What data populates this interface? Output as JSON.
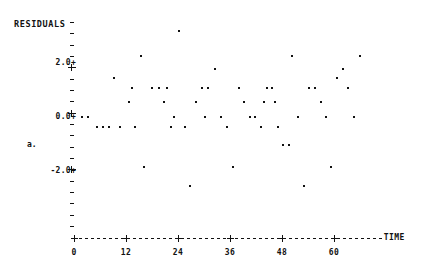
{
  "chart_data": {
    "type": "scatter",
    "title": "",
    "ylabel": "RESIDUALS",
    "xlabel": "TIME",
    "stray_label": "a.",
    "xlim": [
      0,
      70
    ],
    "ylim": [
      -3.0,
      3.0
    ],
    "grid": false,
    "legend": null,
    "x_ticks": [
      0,
      12,
      24,
      36,
      48,
      60
    ],
    "x_tick_labels": [
      "0",
      "12",
      "24",
      "36",
      "48",
      "60"
    ],
    "y_ticks": [
      2.0,
      0.0,
      -2.0
    ],
    "y_tick_labels": [
      "2.0+",
      "0.0+",
      "-2.0+"
    ],
    "y_minor_count": 19,
    "point_marker": "*",
    "points": [
      {
        "x": 1.8,
        "y": 0.0
      },
      {
        "x": 3.2,
        "y": 0.0
      },
      {
        "x": 5.3,
        "y": -0.38
      },
      {
        "x": 6.7,
        "y": -0.38
      },
      {
        "x": 8.1,
        "y": -0.38
      },
      {
        "x": 10.6,
        "y": -0.38
      },
      {
        "x": 9.2,
        "y": 1.43
      },
      {
        "x": 12.6,
        "y": 0.55
      },
      {
        "x": 14.0,
        "y": -0.38
      },
      {
        "x": 15.5,
        "y": 2.26
      },
      {
        "x": 16.2,
        "y": -1.85
      },
      {
        "x": 18.0,
        "y": 1.09
      },
      {
        "x": 19.5,
        "y": 1.09
      },
      {
        "x": 20.8,
        "y": 0.55
      },
      {
        "x": 22.4,
        "y": -0.38
      },
      {
        "x": 24.3,
        "y": 3.2
      },
      {
        "x": 25.6,
        "y": -0.38
      },
      {
        "x": 26.8,
        "y": -2.55
      },
      {
        "x": 28.2,
        "y": 0.55
      },
      {
        "x": 29.6,
        "y": 1.09
      },
      {
        "x": 31.0,
        "y": 1.09
      },
      {
        "x": 32.5,
        "y": 1.76
      },
      {
        "x": 34.0,
        "y": 0.0
      },
      {
        "x": 35.4,
        "y": -0.38
      },
      {
        "x": 36.6,
        "y": -1.85
      },
      {
        "x": 38.0,
        "y": 1.09
      },
      {
        "x": 39.3,
        "y": 0.55
      },
      {
        "x": 40.6,
        "y": 0.0
      },
      {
        "x": 41.8,
        "y": 0.0
      },
      {
        "x": 43.1,
        "y": -0.38
      },
      {
        "x": 44.5,
        "y": 1.09
      },
      {
        "x": 45.8,
        "y": 1.09
      },
      {
        "x": 47.0,
        "y": -0.38
      },
      {
        "x": 48.3,
        "y": -1.03
      },
      {
        "x": 49.5,
        "y": -1.03
      },
      {
        "x": 50.4,
        "y": 2.26
      },
      {
        "x": 51.8,
        "y": 0.0
      },
      {
        "x": 53.0,
        "y": -2.55
      },
      {
        "x": 54.3,
        "y": 1.09
      },
      {
        "x": 55.6,
        "y": 1.09
      },
      {
        "x": 56.9,
        "y": 0.55
      },
      {
        "x": 58.2,
        "y": 0.0
      },
      {
        "x": 59.4,
        "y": -1.85
      },
      {
        "x": 60.8,
        "y": 1.43
      },
      {
        "x": 62.0,
        "y": 1.76
      },
      {
        "x": 63.3,
        "y": 1.09
      },
      {
        "x": 64.6,
        "y": 0.0
      },
      {
        "x": 66.0,
        "y": 2.26
      },
      {
        "x": 23.0,
        "y": 0.0
      },
      {
        "x": 21.5,
        "y": 1.09
      },
      {
        "x": 30.3,
        "y": 0.0
      },
      {
        "x": 13.3,
        "y": 1.09
      },
      {
        "x": 43.8,
        "y": 0.55
      },
      {
        "x": 46.3,
        "y": 0.55
      }
    ]
  }
}
